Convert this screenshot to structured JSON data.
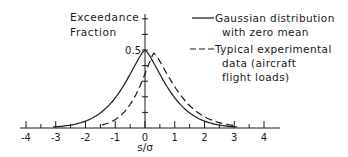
{
  "chart_data": {
    "type": "line",
    "title": "",
    "xlabel": "s/σ",
    "ylabel": "Exceedance Fraction",
    "ylabel_lines": [
      "Exceedance",
      "Fraction"
    ],
    "xlim": [
      -4,
      4
    ],
    "ylim": [
      0,
      0.5
    ],
    "x_ticks": [
      "-4",
      "-3",
      "-2",
      "-1",
      "0",
      "1",
      "2",
      "3",
      "4"
    ],
    "y_tick_labels": [
      "0.5"
    ],
    "grid": false,
    "legend_position": "upper right",
    "series": [
      {
        "name": "Gaussian distribution with zero mean",
        "legend_lines": [
          "Gaussian distribution",
          "with zero mean"
        ],
        "style": "solid",
        "x": [
          -3,
          -2.5,
          -2,
          -1.5,
          -1,
          -0.5,
          0,
          0.5,
          1,
          1.5,
          2,
          2.5,
          3
        ],
        "values": [
          0.0,
          0.003,
          0.023,
          0.067,
          0.159,
          0.309,
          0.5,
          0.309,
          0.159,
          0.067,
          0.023,
          0.003,
          0.0
        ]
      },
      {
        "name": "Typical experimental data (aircraft flight loads)",
        "legend_lines": [
          "Typical experimental",
          "data (aircraft",
          "flight loads)"
        ],
        "style": "dashed",
        "x": [
          -1.5,
          -1,
          -0.5,
          0,
          0.3,
          0.8,
          1.3,
          1.8,
          2.3,
          2.8
        ],
        "values": [
          0.0,
          0.03,
          0.15,
          0.35,
          0.48,
          0.3,
          0.17,
          0.08,
          0.03,
          0.005
        ]
      }
    ]
  }
}
